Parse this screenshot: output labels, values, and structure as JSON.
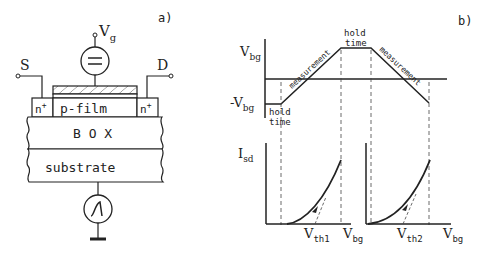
{
  "panel_a": {
    "label": "a)",
    "gate_label": "V",
    "gate_sub": "g",
    "source_label": "S",
    "drain_label": "D",
    "nplus_left": "n",
    "nplus_right": "n",
    "nplus_sup": "+",
    "film_label": "p-film",
    "box_label": "B O X",
    "substrate_label": "substrate"
  },
  "panel_b": {
    "label": "b)",
    "top_plot": {
      "y_label_pos": "V",
      "y_label_pos_sub": "bg",
      "y_label_neg": "-V",
      "y_label_neg_sub": "bg",
      "hold_time_1_line1": "hold",
      "hold_time_1_line2": "time",
      "hold_time_2_line1": "hold",
      "hold_time_2_line2": "time",
      "measurement_1": "measurement",
      "measurement_2": "measurement"
    },
    "bottom_plot": {
      "y_label": "I",
      "y_label_sub": "sd",
      "vth1": "V",
      "vth1_sub": "th1",
      "vth2": "V",
      "vth2_sub": "th2",
      "x_label_1": "V",
      "x_label_1_sub": "bg",
      "x_label_2": "V",
      "x_label_2_sub": "bg"
    }
  }
}
